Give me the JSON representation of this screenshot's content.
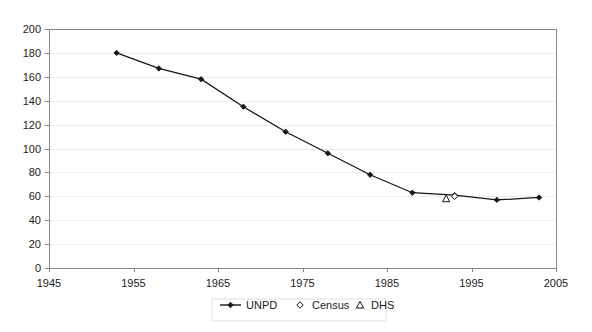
{
  "chart_data": {
    "type": "line",
    "title": "",
    "subtitle": "",
    "xlabel": "",
    "ylabel": "",
    "xlim": [
      1945,
      2005
    ],
    "ylim": [
      0,
      200
    ],
    "x_ticks": [
      1945,
      1955,
      1965,
      1975,
      1985,
      1995,
      2005
    ],
    "y_ticks": [
      0,
      20,
      40,
      60,
      80,
      100,
      120,
      140,
      160,
      180,
      200
    ],
    "grid": "horizontal",
    "legend_position": "bottom",
    "series": [
      {
        "name": "UNPD",
        "marker": "diamond-filled",
        "line": true,
        "points": [
          {
            "x": 1953,
            "y": 180
          },
          {
            "x": 1958,
            "y": 167
          },
          {
            "x": 1963,
            "y": 158
          },
          {
            "x": 1968,
            "y": 135
          },
          {
            "x": 1973,
            "y": 114
          },
          {
            "x": 1978,
            "y": 96
          },
          {
            "x": 1983,
            "y": 78
          },
          {
            "x": 1988,
            "y": 63
          },
          {
            "x": 1993,
            "y": 61
          },
          {
            "x": 1998,
            "y": 57
          },
          {
            "x": 2003,
            "y": 59
          }
        ]
      },
      {
        "name": "Census",
        "marker": "diamond-open",
        "line": false,
        "points": [
          {
            "x": 1993,
            "y": 60
          }
        ]
      },
      {
        "name": "DHS",
        "marker": "triangle-open",
        "line": false,
        "points": [
          {
            "x": 1992,
            "y": 58
          }
        ]
      }
    ]
  },
  "axes": {
    "y_tick_labels": [
      "200",
      "180",
      "160",
      "140",
      "120",
      "100",
      "80",
      "60",
      "40",
      "20",
      "0"
    ],
    "x_tick_labels": [
      "1945",
      "1955",
      "1965",
      "1975",
      "1985",
      "1995",
      "2005"
    ]
  },
  "legend": {
    "entries": [
      {
        "label": "UNPD",
        "marker": "line-diamond-filled"
      },
      {
        "label": "Census",
        "marker": "diamond-open"
      },
      {
        "label": "DHS",
        "marker": "triangle-open"
      }
    ]
  },
  "colors": {
    "series_line": "#151515",
    "gridline": "#ececec",
    "axis": "#8a8a8a",
    "text": "#1b1b1b",
    "background": "#ffffff"
  }
}
